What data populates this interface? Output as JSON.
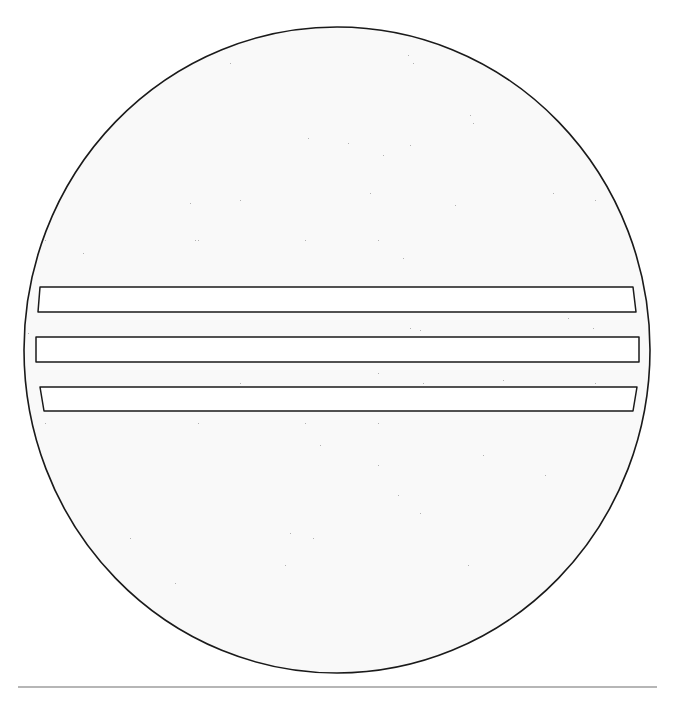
{
  "figure": {
    "colors": {
      "background": "#ffffff",
      "disc_fill": "#d9d9d9",
      "stipple_dark": "#8a8a8a",
      "stipple_light": "#f2f2f2",
      "outline": "#1a1a1a",
      "bar_fill": "#ffffff",
      "rule_line": "#6e6e6e"
    },
    "disc": {
      "cx": 337,
      "cy": 350,
      "rx": 313,
      "ry": 323
    },
    "bars": [
      {
        "top": 287,
        "bottom": 312,
        "left_top": 40,
        "left_bottom": 38,
        "right_top": 633,
        "right_bottom": 636
      },
      {
        "top": 337,
        "bottom": 362,
        "left_top": 36,
        "left_bottom": 36,
        "right_top": 639,
        "right_bottom": 639
      },
      {
        "top": 387,
        "bottom": 411,
        "left_top": 40,
        "left_bottom": 44,
        "right_top": 637,
        "right_bottom": 633
      }
    ],
    "rule": {
      "x1": 18,
      "x2": 657,
      "y": 687
    }
  }
}
